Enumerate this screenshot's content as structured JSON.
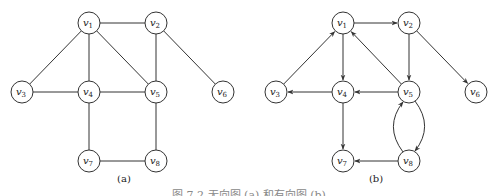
{
  "figure": {
    "caption": "图 7.2   无向图 (a) 和有向图 (b)",
    "colors": {
      "stroke": "#333333",
      "node_fill": "#ffffff",
      "text": "#222222"
    },
    "node_radius": 11
  },
  "graph_a": {
    "label": "(a)",
    "type": "undirected",
    "nodes": [
      {
        "id": "v1",
        "name": "v",
        "sub": "1",
        "x": 89,
        "y": 23
      },
      {
        "id": "v2",
        "name": "v",
        "sub": "2",
        "x": 156,
        "y": 23
      },
      {
        "id": "v3",
        "name": "v",
        "sub": "3",
        "x": 22,
        "y": 92
      },
      {
        "id": "v4",
        "name": "v",
        "sub": "4",
        "x": 89,
        "y": 92
      },
      {
        "id": "v5",
        "name": "v",
        "sub": "5",
        "x": 156,
        "y": 92
      },
      {
        "id": "v6",
        "name": "v",
        "sub": "6",
        "x": 223,
        "y": 92
      },
      {
        "id": "v7",
        "name": "v",
        "sub": "7",
        "x": 89,
        "y": 161
      },
      {
        "id": "v8",
        "name": "v",
        "sub": "8",
        "x": 156,
        "y": 161
      }
    ],
    "edges": [
      [
        "v1",
        "v2"
      ],
      [
        "v1",
        "v3"
      ],
      [
        "v1",
        "v4"
      ],
      [
        "v1",
        "v5"
      ],
      [
        "v2",
        "v5"
      ],
      [
        "v2",
        "v6"
      ],
      [
        "v3",
        "v4"
      ],
      [
        "v4",
        "v5"
      ],
      [
        "v4",
        "v7"
      ],
      [
        "v5",
        "v8"
      ],
      [
        "v7",
        "v8"
      ]
    ]
  },
  "graph_b": {
    "label": "(b)",
    "type": "directed",
    "nodes": [
      {
        "id": "v1",
        "name": "v",
        "sub": "1",
        "x": 343,
        "y": 23
      },
      {
        "id": "v2",
        "name": "v",
        "sub": "2",
        "x": 409,
        "y": 23
      },
      {
        "id": "v3",
        "name": "v",
        "sub": "3",
        "x": 276,
        "y": 92
      },
      {
        "id": "v4",
        "name": "v",
        "sub": "4",
        "x": 343,
        "y": 92
      },
      {
        "id": "v5",
        "name": "v",
        "sub": "5",
        "x": 409,
        "y": 92
      },
      {
        "id": "v6",
        "name": "v",
        "sub": "6",
        "x": 476,
        "y": 92
      },
      {
        "id": "v7",
        "name": "v",
        "sub": "7",
        "x": 343,
        "y": 161
      },
      {
        "id": "v8",
        "name": "v",
        "sub": "8",
        "x": 409,
        "y": 161
      }
    ],
    "edges": [
      {
        "from": "v1",
        "to": "v2"
      },
      {
        "from": "v3",
        "to": "v1"
      },
      {
        "from": "v1",
        "to": "v4"
      },
      {
        "from": "v5",
        "to": "v1"
      },
      {
        "from": "v2",
        "to": "v5"
      },
      {
        "from": "v2",
        "to": "v6"
      },
      {
        "from": "v4",
        "to": "v3"
      },
      {
        "from": "v5",
        "to": "v4"
      },
      {
        "from": "v4",
        "to": "v7"
      },
      {
        "from": "v8",
        "to": "v7"
      },
      {
        "from": "v5",
        "to": "v8",
        "curve": "right"
      },
      {
        "from": "v8",
        "to": "v5",
        "curve": "left"
      }
    ]
  }
}
